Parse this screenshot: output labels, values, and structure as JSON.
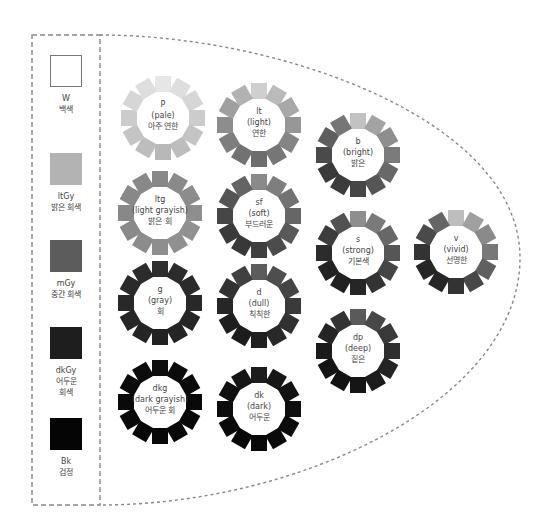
{
  "achromatic": [
    {
      "code": "W",
      "name_ko": "백색",
      "color": "#ffffff"
    },
    {
      "code": "ltGy",
      "name_ko": "밝은 회색",
      "color": "#b3b3b3"
    },
    {
      "code": "mGy",
      "name_ko": "중간 회색",
      "color": "#5c5c5c"
    },
    {
      "code": "dkGy",
      "name_ko": "어두운 회색",
      "name_ko_line1": "어두운",
      "name_ko_line2": "회색",
      "color": "#1e1e1e"
    },
    {
      "code": "Bk",
      "name_ko": "검정",
      "color": "#050505"
    }
  ],
  "tones": {
    "p": {
      "code": "P",
      "name_en": "(pale)",
      "name_ko": "아주 연한",
      "colors": [
        "#e6e6e6",
        "#dedede",
        "#d6d6d6",
        "#cccccc",
        "#c4c4c4",
        "#bdbdbd",
        "#b8b8b8",
        "#bdbdbd",
        "#c4c4c4",
        "#cccccc",
        "#d6d6d6",
        "#dedede"
      ]
    },
    "lt": {
      "code": "lt",
      "name_en": "(light)",
      "name_ko": "연한",
      "colors": [
        "#cfcfcf",
        "#bababa",
        "#a8a8a8",
        "#979797",
        "#858585",
        "#767676",
        "#6d6d6d",
        "#727272",
        "#7e7e7e",
        "#8d8d8d",
        "#9f9f9f",
        "#b2b2b2"
      ]
    },
    "b": {
      "code": "b",
      "name_en": "(bright)",
      "name_ko": "밝은",
      "colors": [
        "#c2c2c2",
        "#a3a3a3",
        "#8e8e8e",
        "#7b7b7b",
        "#686868",
        "#555555",
        "#464646",
        "#3c3c3c",
        "#3a3a3a",
        "#4a4a4a",
        "#5e5e5e",
        "#767676"
      ]
    },
    "ltg": {
      "code": "ltg",
      "name_en": "(light grayish)",
      "name_ko": "밝은 회",
      "colors": [
        "#888888",
        "#8a8a8a",
        "#8c8c8c",
        "#8e8e8e",
        "#909090",
        "#909090",
        "#8e8e8e",
        "#8c8c8c",
        "#8a8a8a",
        "#888888",
        "#888888",
        "#888888"
      ]
    },
    "sf": {
      "code": "sf",
      "name_en": "(soft)",
      "name_ko": "부드러운",
      "colors": [
        "#8a8a8a",
        "#7e7e7e",
        "#727272",
        "#666666",
        "#595959",
        "#4c4c4c",
        "#3f3f3f",
        "#383838",
        "#3a3a3a",
        "#464646",
        "#555555",
        "#646464"
      ]
    },
    "s": {
      "code": "s",
      "name_en": "(strong)",
      "name_ko": "기본색",
      "colors": [
        "#8e8e8e",
        "#7a7a7a",
        "#676767",
        "#565656",
        "#454545",
        "#333333",
        "#262626",
        "#202020",
        "#222222",
        "#2c2c2c",
        "#3c3c3c",
        "#525252"
      ]
    },
    "v": {
      "code": "v",
      "name_en": "(vivid)",
      "name_ko": "선명한",
      "colors": [
        "#bdbdbd",
        "#a0a0a0",
        "#8a8a8a",
        "#787878",
        "#606060",
        "#474747",
        "#333333",
        "#262626",
        "#262626",
        "#333333",
        "#4a4a4a",
        "#656565"
      ]
    },
    "g": {
      "code": "g",
      "name_en": "(gray)",
      "name_ko": "회",
      "colors": [
        "#2e2e2e",
        "#2c2c2c",
        "#2a2a2a",
        "#282828",
        "#262626",
        "#242424",
        "#222222",
        "#242424",
        "#262626",
        "#282828",
        "#2a2a2a",
        "#2c2c2c"
      ]
    },
    "d": {
      "code": "d",
      "name_en": "(dull)",
      "name_ko": "칙칙한",
      "colors": [
        "#5c5c5c",
        "#4e4e4e",
        "#444444",
        "#3a3a3a",
        "#313131",
        "#282828",
        "#202020",
        "#1c1c1c",
        "#1e1e1e",
        "#262626",
        "#313131",
        "#404040"
      ]
    },
    "dp": {
      "code": "dp",
      "name_en": "(deep)",
      "name_ko": "짙은",
      "colors": [
        "#5a5a5a",
        "#484848",
        "#3a3a3a",
        "#2e2e2e",
        "#242424",
        "#1c1c1c",
        "#151515",
        "#121212",
        "#141414",
        "#1a1a1a",
        "#242424",
        "#333333"
      ]
    },
    "dkg": {
      "code": "dkg",
      "name_en": "(dark grayish)",
      "name_ko": "어두운 회",
      "colors": [
        "#0c0c0c",
        "#0b0b0b",
        "#0a0a0a",
        "#090909",
        "#080808",
        "#080808",
        "#080808",
        "#080808",
        "#090909",
        "#0a0a0a",
        "#0b0b0b",
        "#0c0c0c"
      ]
    },
    "dk": {
      "code": "dk",
      "name_en": "(dark)",
      "name_ko": "어두운",
      "colors": [
        "#1c1c1c",
        "#161616",
        "#121212",
        "#0f0f0f",
        "#0c0c0c",
        "#0a0a0a",
        "#080808",
        "#080808",
        "#0a0a0a",
        "#0c0c0c",
        "#101010",
        "#161616"
      ]
    }
  },
  "outline": {
    "stroke_color": "#888888"
  }
}
